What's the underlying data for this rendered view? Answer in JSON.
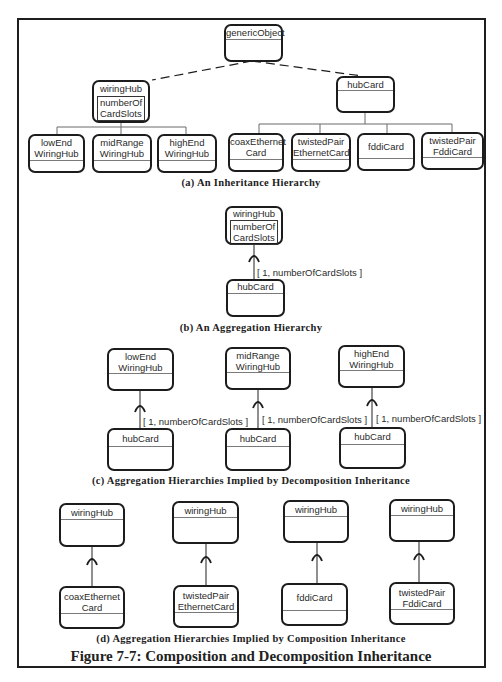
{
  "figure": {
    "title": "Figure 7-7: Composition and Decomposition Inheritance"
  },
  "section_a": {
    "caption": "(a)  An Inheritance Hierarchy",
    "root": {
      "name": "genericObject"
    },
    "wiringHub": {
      "name": "wiringHub",
      "attribute": "numberOf CardSlots",
      "attr_line1": "numberOf",
      "attr_line2": "CardSlots"
    },
    "hubCard": {
      "name": "hubCard"
    },
    "hub_subclasses": [
      {
        "line1": "lowEnd",
        "line2": "WiringHub"
      },
      {
        "line1": "midRange",
        "line2": "WiringHub"
      },
      {
        "line1": "highEnd",
        "line2": "WiringHub"
      }
    ],
    "card_subclasses": [
      {
        "line1": "coaxEthernet",
        "line2": "Card"
      },
      {
        "line1": "twistedPair",
        "line2": "EthernetCard"
      },
      {
        "line1": "fddiCard",
        "line2": ""
      },
      {
        "line1": "twistedPair",
        "line2": "FddiCard"
      }
    ]
  },
  "section_b": {
    "caption": "(b) An Aggregation Hierarchy",
    "whole": {
      "name": "wiringHub",
      "attr_line1": "numberOf",
      "attr_line2": "CardSlots"
    },
    "part": {
      "name": "hubCard"
    },
    "multiplicity": "[ 1, numberOfCardSlots ]"
  },
  "section_c": {
    "caption": "(c) Aggregation Hierarchies Implied by Decomposition Inheritance",
    "pairs": [
      {
        "whole_line1": "lowEnd",
        "whole_line2": "WiringHub",
        "part": "hubCard",
        "multiplicity": "[ 1, numberOfCardSlots ]"
      },
      {
        "whole_line1": "midRange",
        "whole_line2": "WiringHub",
        "part": "hubCard",
        "multiplicity": "[ 1, numberOfCardSlots ]"
      },
      {
        "whole_line1": "highEnd",
        "whole_line2": "WiringHub",
        "part": "hubCard",
        "multiplicity": "[ 1, numberOfCardSlots ]"
      }
    ]
  },
  "section_d": {
    "caption": "(d) Aggregation Hierarchies Implied by Composition Inheritance",
    "pairs": [
      {
        "whole": "wiringHub",
        "part_line1": "coaxEthernet",
        "part_line2": "Card"
      },
      {
        "whole": "wiringHub",
        "part_line1": "twistedPair",
        "part_line2": "EthernetCard"
      },
      {
        "whole": "wiringHub",
        "part_line1": "fddiCard",
        "part_line2": ""
      },
      {
        "whole": "wiringHub",
        "part_line1": "twistedPair",
        "part_line2": "FddiCard"
      }
    ]
  },
  "colors": {
    "line": "#1c1c1c",
    "thin_line": "#6a6a6a",
    "text": "#2a2a2a"
  }
}
